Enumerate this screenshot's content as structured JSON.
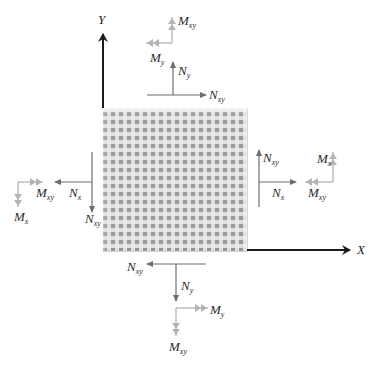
{
  "diagram": {
    "axes": {
      "x_label": "X",
      "y_label": "Y"
    },
    "panel": {
      "description": "textured square plate element"
    },
    "colors": {
      "axis": "#1a1a1a",
      "force_arrow": "#6e6e6e",
      "moment_arrow": "#b4b4b4",
      "panel_base": "#9a9a9a"
    },
    "labels": {
      "top": {
        "moment_xy": {
          "main": "M",
          "sub": "xy"
        },
        "moment_y": {
          "main": "M",
          "sub": "y"
        },
        "force_y": {
          "main": "N",
          "sub": "y"
        },
        "force_xy": {
          "main": "N",
          "sub": "xy"
        }
      },
      "left": {
        "moment_xy": {
          "main": "M",
          "sub": "xy"
        },
        "moment_x": {
          "main": "M",
          "sub": "x"
        },
        "force_x": {
          "main": "N",
          "sub": "x"
        },
        "force_xy": {
          "main": "N",
          "sub": "xy"
        }
      },
      "right": {
        "force_xy": {
          "main": "N",
          "sub": "xy"
        },
        "force_x": {
          "main": "N",
          "sub": "x"
        },
        "moment_x": {
          "main": "M",
          "sub": "x"
        },
        "moment_xy": {
          "main": "M",
          "sub": "xy"
        }
      },
      "bottom": {
        "force_xy": {
          "main": "N",
          "sub": "xy"
        },
        "force_y": {
          "main": "N",
          "sub": "y"
        },
        "moment_y": {
          "main": "M",
          "sub": "y"
        },
        "moment_xy": {
          "main": "M",
          "sub": "xy"
        }
      }
    }
  }
}
